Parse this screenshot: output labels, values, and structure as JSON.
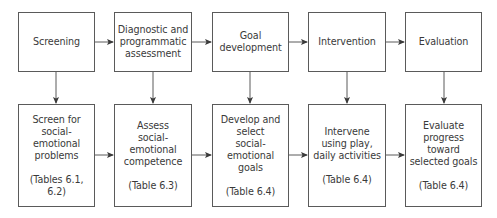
{
  "stages": [
    {
      "id": "screening",
      "label": [
        "Screening"
      ],
      "detail": [
        "Screen for",
        "social-",
        "emotional",
        "problems"
      ],
      "ref": [
        "(Tables 6.1,",
        "6.2)"
      ]
    },
    {
      "id": "assessment",
      "label": [
        "Diagnostic and",
        "programmatic",
        "assessment"
      ],
      "detail": [
        "Assess",
        "social-",
        "emotional",
        "competence"
      ],
      "ref": [
        "(Table 6.3)"
      ]
    },
    {
      "id": "goal-development",
      "label": [
        "Goal",
        "development"
      ],
      "detail": [
        "Develop and",
        "select",
        "social-",
        "emotional",
        "goals"
      ],
      "ref": [
        "(Table 6.4)"
      ]
    },
    {
      "id": "intervention",
      "label": [
        "Intervention"
      ],
      "detail": [
        "Intervene",
        "using play,",
        "daily activities"
      ],
      "ref": [
        "(Table 6.4)"
      ]
    },
    {
      "id": "evaluation",
      "label": [
        "Evaluation"
      ],
      "detail": [
        "Evaluate",
        "progress",
        "toward",
        "selected goals"
      ],
      "ref": [
        "(Table 6.4)"
      ]
    }
  ],
  "colors": {
    "line": "#5a5a5a",
    "text": "#3a3a3a",
    "background": "#ffffff"
  }
}
